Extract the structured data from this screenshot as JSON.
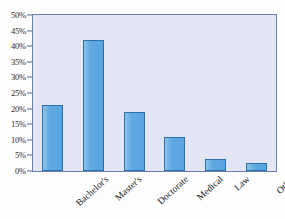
{
  "chart_data": {
    "type": "bar",
    "title": "",
    "subtitle": "",
    "xlabel": "",
    "ylabel": "",
    "categories": [
      "Bachelor's",
      "Master's",
      "Doctorate",
      "Medical",
      "Law",
      "Other"
    ],
    "values": [
      21,
      42,
      19,
      11,
      4,
      2.5
    ],
    "series": [
      {
        "name": "",
        "values": [
          21,
          42,
          19,
          11,
          4,
          2.5
        ]
      }
    ],
    "ylim": [
      0,
      50
    ],
    "ytick_values": [
      0,
      5,
      10,
      15,
      20,
      25,
      30,
      35,
      40,
      45,
      50
    ],
    "ytick_labels": [
      "0%",
      "5%",
      "10%",
      "15%",
      "20%",
      "25%",
      "30%",
      "35%",
      "40%",
      "45%",
      "50%"
    ],
    "value_format": "percent",
    "grid": false,
    "legend": false,
    "legend_position": "none",
    "xtick_rotation": -42,
    "colors": {
      "bar_fill": "#5fa9e2",
      "bar_border": "#2f6fa8",
      "plot_background": "#e2e6f4",
      "frame_border": "#6a7fae",
      "tick_label": "#2b2b2b",
      "figure_background": "#fdfdfd"
    }
  }
}
